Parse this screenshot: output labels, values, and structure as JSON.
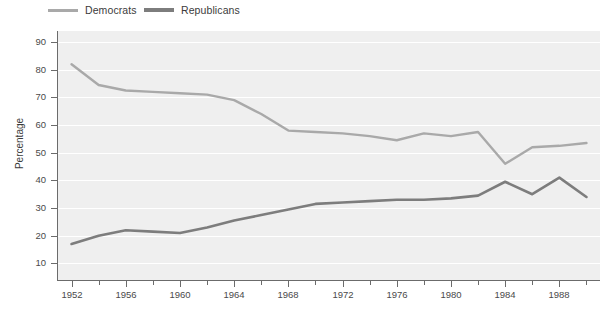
{
  "legend": {
    "position": "top-left",
    "items": [
      {
        "label": "Democrats",
        "color": "#a9a9a9",
        "name": "democrats"
      },
      {
        "label": "Republicans",
        "color": "#7d7d7d",
        "name": "republicans"
      }
    ]
  },
  "axes": {
    "y_title": "Percentage",
    "y_ticks": [
      10,
      20,
      30,
      40,
      50,
      60,
      70,
      80,
      90
    ],
    "x_major_ticks": [
      1952,
      1956,
      1960,
      1964,
      1968,
      1972,
      1976,
      1980,
      1984,
      1988
    ],
    "x_minor_ticks": [
      1954,
      1958,
      1962,
      1966,
      1970,
      1974,
      1978,
      1982,
      1986,
      1990
    ]
  },
  "chart_data": {
    "type": "line",
    "title": "",
    "subtitle": "",
    "xlabel": "",
    "ylabel": "Percentage",
    "xlim": [
      1951,
      1991
    ],
    "ylim": [
      4,
      94
    ],
    "grid": true,
    "legend_position": "top-left",
    "x": [
      1952,
      1954,
      1956,
      1958,
      1960,
      1962,
      1964,
      1966,
      1968,
      1970,
      1972,
      1974,
      1976,
      1978,
      1980,
      1982,
      1984,
      1986,
      1988,
      1990
    ],
    "series": [
      {
        "name": "Democrats",
        "color": "#a9a9a9",
        "values": [
          82,
          74.5,
          72.5,
          72,
          71.5,
          71,
          69,
          64,
          58,
          57.5,
          57,
          56,
          54.5,
          57,
          56,
          57.5,
          46,
          52,
          52.5,
          53.5
        ]
      },
      {
        "name": "Republicans",
        "color": "#7d7d7d",
        "values": [
          17,
          20,
          22,
          21.5,
          21,
          23,
          25.5,
          27.5,
          29.5,
          31.5,
          32,
          32.5,
          33,
          33,
          33.5,
          34.5,
          39.5,
          35,
          41,
          34
        ]
      }
    ]
  },
  "colors": {
    "plot_background": "#efefef",
    "gridline": "#ffffff",
    "axis": "#6b6b6b",
    "text": "#4a4a4a",
    "page_background": "#ffffff"
  }
}
